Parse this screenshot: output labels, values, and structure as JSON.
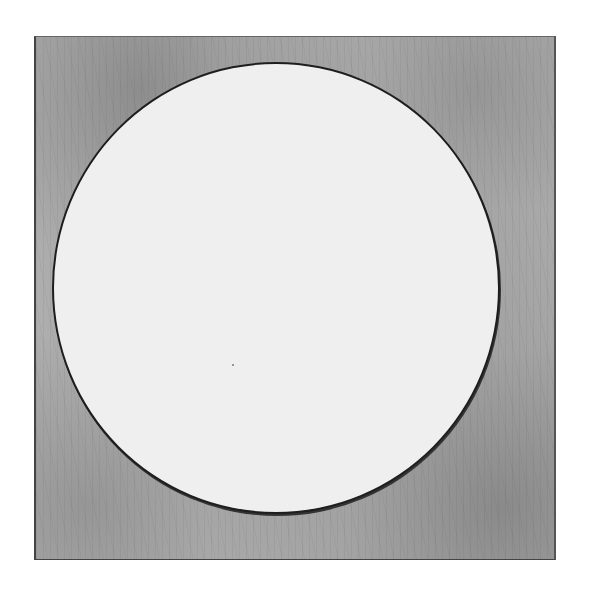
{
  "artwork": {
    "description": "Etching of a large white circle outlined in black on a square textured gray plate",
    "colors": {
      "background": "#ffffff",
      "plate": "#b9b9b9",
      "circle_fill": "#efefef",
      "circle_outline": "#1e1e1e"
    }
  }
}
